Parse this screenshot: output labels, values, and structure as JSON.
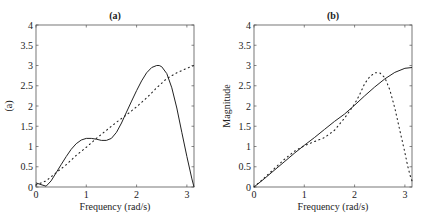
{
  "chart_data": [
    {
      "type": "line",
      "title": "(a)",
      "xlabel": "Frequency (rad/s)",
      "ylabel": "(a)",
      "xlim": [
        0,
        3.1416
      ],
      "ylim": [
        0,
        4
      ],
      "xticks": [
        "0",
        "1",
        "2",
        "3"
      ],
      "yticks": [
        "0",
        "0.5",
        "1",
        "1.5",
        "2",
        "2.5",
        "3",
        "3.5",
        "4"
      ],
      "grid": false,
      "legend": null,
      "series": [
        {
          "name": "solid",
          "style": "solid",
          "x": [
            0,
            0.1,
            0.2,
            0.3,
            0.4,
            0.5,
            0.6,
            0.7,
            0.8,
            0.9,
            1.0,
            1.1,
            1.2,
            1.3,
            1.4,
            1.5,
            1.6,
            1.7,
            1.8,
            1.9,
            2.0,
            2.1,
            2.2,
            2.3,
            2.4,
            2.45,
            2.5,
            2.6,
            2.7,
            2.8,
            2.9,
            3.0,
            3.1,
            3.1416
          ],
          "y": [
            0.1,
            0.06,
            0.02,
            0.15,
            0.35,
            0.55,
            0.75,
            0.93,
            1.07,
            1.16,
            1.2,
            1.2,
            1.18,
            1.15,
            1.15,
            1.2,
            1.35,
            1.58,
            1.85,
            2.12,
            2.38,
            2.62,
            2.82,
            2.95,
            3.0,
            3.0,
            2.97,
            2.8,
            2.45,
            1.95,
            1.35,
            0.75,
            0.2,
            0.0
          ]
        },
        {
          "name": "dotted",
          "style": "dotted",
          "x": [
            0,
            0.2,
            0.4,
            0.6,
            0.8,
            1.0,
            1.2,
            1.4,
            1.6,
            1.8,
            2.0,
            2.2,
            2.4,
            2.6,
            2.8,
            3.0,
            3.1416
          ],
          "y": [
            0.05,
            0.15,
            0.35,
            0.55,
            0.78,
            0.98,
            1.2,
            1.4,
            1.6,
            1.78,
            1.98,
            2.2,
            2.45,
            2.68,
            2.82,
            2.93,
            3.0
          ]
        }
      ]
    },
    {
      "type": "line",
      "title": "(b)",
      "xlabel": "Frequency (rad/s)",
      "ylabel": "Magnitude",
      "xlim": [
        0,
        3.1416
      ],
      "ylim": [
        0,
        4
      ],
      "xticks": [
        "0",
        "1",
        "2",
        "3"
      ],
      "yticks": [
        "0",
        "0.5",
        "1",
        "1.5",
        "2",
        "2.5",
        "3",
        "3.5",
        "4"
      ],
      "grid": false,
      "legend": null,
      "series": [
        {
          "name": "solid",
          "style": "solid",
          "x": [
            0,
            0.2,
            0.4,
            0.6,
            0.8,
            1.0,
            1.2,
            1.4,
            1.6,
            1.8,
            2.0,
            2.2,
            2.4,
            2.6,
            2.8,
            3.0,
            3.1416
          ],
          "y": [
            0.0,
            0.2,
            0.41,
            0.62,
            0.83,
            1.03,
            1.22,
            1.42,
            1.62,
            1.8,
            2.02,
            2.25,
            2.47,
            2.67,
            2.83,
            2.93,
            2.95
          ]
        },
        {
          "name": "dotted",
          "style": "dotted",
          "x": [
            0,
            0.2,
            0.4,
            0.6,
            0.8,
            1.0,
            1.2,
            1.4,
            1.6,
            1.8,
            2.0,
            2.1,
            2.2,
            2.3,
            2.4,
            2.5,
            2.6,
            2.7,
            2.8,
            2.9,
            3.0,
            3.05,
            3.1,
            3.1416
          ],
          "y": [
            0.0,
            0.22,
            0.45,
            0.68,
            0.88,
            1.02,
            1.12,
            1.22,
            1.4,
            1.7,
            2.05,
            2.28,
            2.55,
            2.72,
            2.82,
            2.82,
            2.7,
            2.4,
            1.95,
            1.4,
            0.85,
            0.55,
            0.3,
            0.15
          ]
        }
      ]
    }
  ]
}
